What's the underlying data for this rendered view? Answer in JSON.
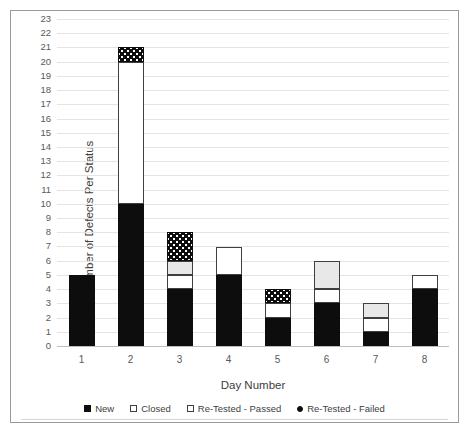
{
  "chart_data": {
    "type": "bar",
    "stacked": true,
    "title": "",
    "xlabel": "Day Number",
    "ylabel": "Number of Defects Per Status",
    "categories": [
      "1",
      "2",
      "3",
      "4",
      "5",
      "6",
      "7",
      "8"
    ],
    "ylim": [
      0,
      23
    ],
    "ytick_step": 1,
    "yticks": [
      "0",
      "1",
      "2",
      "3",
      "4",
      "5",
      "6",
      "7",
      "8",
      "9",
      "10",
      "11",
      "12",
      "13",
      "14",
      "15",
      "16",
      "17",
      "18",
      "19",
      "20",
      "21",
      "22",
      "23"
    ],
    "grid": true,
    "legend_position": "bottom",
    "series": [
      {
        "name": "New",
        "color": "#0d0d0d",
        "pattern": "solid",
        "values": [
          5,
          10,
          4,
          5,
          2,
          3,
          1,
          4
        ]
      },
      {
        "name": "Closed",
        "color": "#ffffff",
        "pattern": "outline",
        "values": [
          0,
          10,
          1,
          2,
          1,
          1,
          1,
          1
        ]
      },
      {
        "name": "Re-Tested - Passed",
        "color": "#e8e8e8",
        "pattern": "light-fill",
        "values": [
          0,
          0,
          1,
          0,
          0,
          2,
          1,
          0
        ]
      },
      {
        "name": "Re-Tested - Failed",
        "color": "#0d0d0d",
        "pattern": "dotted",
        "values": [
          0,
          1,
          2,
          0,
          1,
          0,
          0,
          0
        ]
      }
    ],
    "totals": [
      5,
      21,
      8,
      7,
      4,
      6,
      3,
      5
    ]
  },
  "legend": {
    "items": [
      {
        "label": "New",
        "swatch": "legend-swatch-new"
      },
      {
        "label": "Closed",
        "swatch": "legend-swatch-closed"
      },
      {
        "label": "Re-Tested - Passed",
        "swatch": "legend-swatch-passed"
      },
      {
        "label": "Re-Tested - Failed",
        "swatch": "legend-swatch-failed"
      }
    ]
  }
}
